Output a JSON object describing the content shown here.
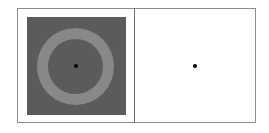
{
  "stimulus": {
    "left_panel": {
      "background_color": "#5b5b5b",
      "ring_color": "#888888",
      "fixation_dot_color": "#000000"
    },
    "right_panel": {
      "background_color": "#ffffff",
      "fixation_dot_color": "#000000"
    },
    "frame_color": "#8c8c8c"
  }
}
